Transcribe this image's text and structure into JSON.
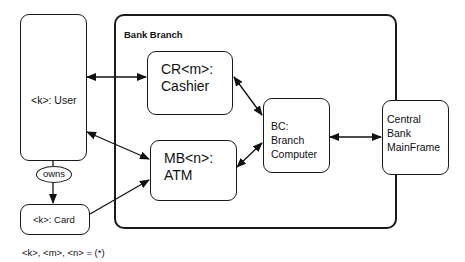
{
  "diagram": {
    "container": {
      "title": "Bank Branch"
    },
    "nodes": {
      "user": {
        "label": "<k>: User"
      },
      "cashier": {
        "line1": "CR<m>:",
        "line2": "Cashier"
      },
      "atm": {
        "line1": "MB<n>:",
        "line2": "ATM"
      },
      "branch_computer": {
        "line1": "BC:",
        "line2": "Branch",
        "line3": "Computer"
      },
      "central": {
        "line1": "Central",
        "line2": "Bank",
        "line3": "MainFrame"
      },
      "card": {
        "label": "<k>: Card"
      }
    },
    "relation": {
      "owns_label": "owns"
    },
    "edges": [
      {
        "from": "user",
        "to": "cashier",
        "type": "bidirectional"
      },
      {
        "from": "user",
        "to": "atm",
        "type": "bidirectional"
      },
      {
        "from": "card",
        "to": "atm",
        "type": "directed"
      },
      {
        "from": "cashier",
        "to": "branch_computer",
        "type": "bidirectional"
      },
      {
        "from": "atm",
        "to": "branch_computer",
        "type": "bidirectional"
      },
      {
        "from": "branch_computer",
        "to": "central",
        "type": "bidirectional"
      },
      {
        "from": "user",
        "to": "card",
        "type": "owns"
      }
    ],
    "footnote": "<k>, <m>, <n> = (*)"
  }
}
